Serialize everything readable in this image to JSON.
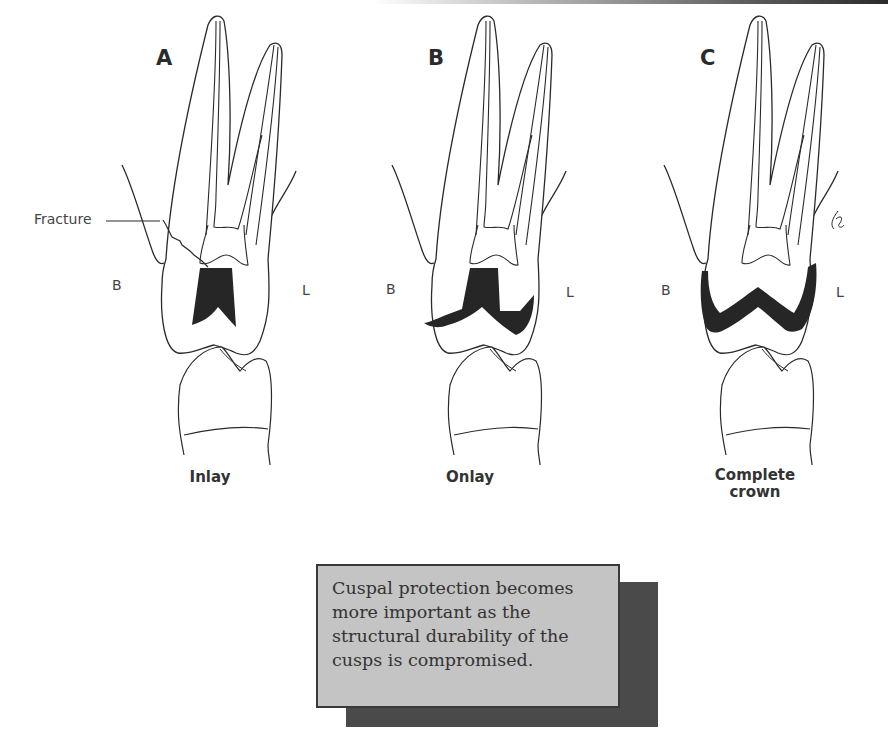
{
  "figure": {
    "panels": [
      {
        "letter": "A",
        "caption_lines": [
          "Inlay"
        ],
        "buccal_label": "B",
        "lingual_label": "L",
        "restoration": "inlay"
      },
      {
        "letter": "B",
        "caption_lines": [
          "Onlay"
        ],
        "buccal_label": "B",
        "lingual_label": "L",
        "restoration": "onlay"
      },
      {
        "letter": "C",
        "caption_lines": [
          "Complete",
          "crown"
        ],
        "buccal_label": "B",
        "lingual_label": "L",
        "restoration": "complete-crown"
      }
    ],
    "annotation": {
      "label": "Fracture"
    },
    "colors": {
      "line": "#2a2a2a",
      "restoration_fill": "#262626",
      "note_bg": "#c4c4c4",
      "note_shadow": "#4a4a4a"
    }
  },
  "note": {
    "lines": [
      "Cuspal protection becomes",
      "more important as the",
      "structural durability of the",
      "cusps is compromised."
    ]
  }
}
